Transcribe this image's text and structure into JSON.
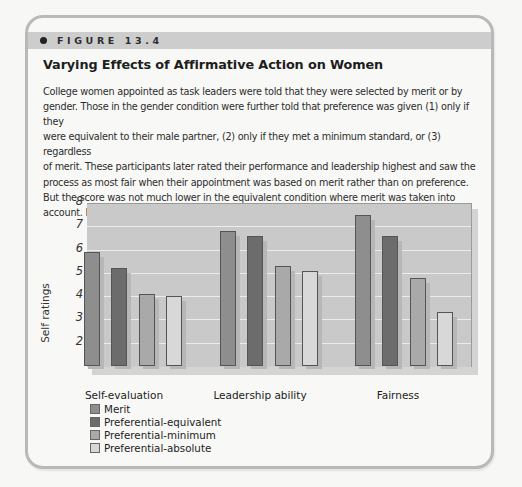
{
  "figure": {
    "label": "FIGURE 13.4",
    "title": "Varying Effects of Affirmative Action on Women",
    "caption_lines": [
      "College women appointed as task leaders were told that they were selected by merit or by",
      "gender. Those in the gender condition were further told that preference was given (1) only if they",
      "were equivalent to their male partner, (2) only if they met a minimum standard, or (3) regardless",
      "of merit. These participants later rated their performance and leadership highest and saw the",
      "process as most fair when their appointment was based on merit rather than on preference.",
      "But the score was not much lower in the equivalent condition where merit was taken into",
      "account.  Heilman et al., 1998"
    ]
  },
  "chart_data": {
    "type": "bar",
    "title": "Varying Effects of Affirmative Action on Women",
    "xlabel": "",
    "ylabel": "Self ratings",
    "ylim": [
      1,
      8
    ],
    "yticks": [
      2,
      3,
      4,
      5,
      6,
      7,
      8
    ],
    "grid": true,
    "legend_position": "bottom-left",
    "categories": [
      "Self-evaluation",
      "Leadership ability",
      "Fairness"
    ],
    "series": [
      {
        "name": "Merit",
        "color": "#8e8e8e",
        "values": [
          5.9,
          6.8,
          7.5
        ]
      },
      {
        "name": "Preferential-equivalent",
        "color": "#6c6c6c",
        "values": [
          5.2,
          6.6,
          6.6
        ]
      },
      {
        "name": "Preferential-minimum",
        "color": "#a9a9a9",
        "values": [
          4.1,
          5.3,
          4.8
        ]
      },
      {
        "name": "Preferential-absolute",
        "color": "#d8d8d8",
        "values": [
          4.0,
          5.1,
          3.3
        ]
      }
    ]
  }
}
